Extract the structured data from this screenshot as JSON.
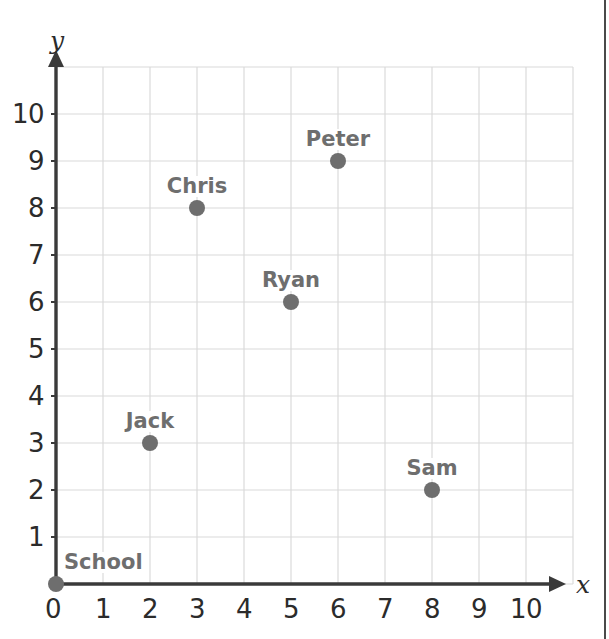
{
  "chart_data": {
    "type": "scatter",
    "title": "",
    "xlabel": "x",
    "ylabel": "y",
    "xlim": [
      0,
      11
    ],
    "ylim": [
      0,
      11
    ],
    "grid": true,
    "legend": "none",
    "x_ticks": [
      "0",
      "1",
      "2",
      "3",
      "4",
      "5",
      "6",
      "7",
      "8",
      "9",
      "10"
    ],
    "y_ticks": [
      "1",
      "2",
      "3",
      "4",
      "5",
      "6",
      "7",
      "8",
      "9",
      "10"
    ],
    "x_tick_values": [
      0,
      1,
      2,
      3,
      4,
      5,
      6,
      7,
      8,
      9,
      10
    ],
    "y_tick_values": [
      1,
      2,
      3,
      4,
      5,
      6,
      7,
      8,
      9,
      10
    ],
    "points": [
      {
        "label": "School",
        "x": 0,
        "y": 0,
        "label_anchor": "left"
      },
      {
        "label": "Jack",
        "x": 2,
        "y": 3,
        "label_anchor": "center"
      },
      {
        "label": "Chris",
        "x": 3,
        "y": 8,
        "label_anchor": "center"
      },
      {
        "label": "Ryan",
        "x": 5,
        "y": 6,
        "label_anchor": "center"
      },
      {
        "label": "Peter",
        "x": 6,
        "y": 9,
        "label_anchor": "center"
      },
      {
        "label": "Sam",
        "x": 8,
        "y": 2,
        "label_anchor": "center"
      }
    ]
  },
  "colors": {
    "grid": "#dadada",
    "axis": "#3a3a3a",
    "point": "#6e6e6e",
    "point_label": "#6e6e6e",
    "tick_label": "#2b2b2b",
    "page_border": "#4a4a4a",
    "background": "#ffffff"
  },
  "geometry": {
    "origin_x": 56,
    "origin_y": 584,
    "unit": 47,
    "grid_max_x": 11,
    "grid_max_y": 11,
    "dot_radius": 8,
    "y_axis_arrow_top": 50,
    "x_axis_arrow_right": 566,
    "page_border_x": 605
  }
}
